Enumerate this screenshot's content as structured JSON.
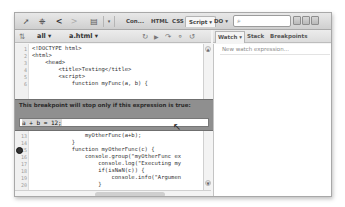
{
  "toolbar": {
    "icons": [
      "inspect-icon",
      "select-element-icon",
      "back-icon",
      "forward-icon",
      "menu-icon",
      "dropdown-icon"
    ],
    "tabs": [
      {
        "label": "Con..."
      },
      {
        "label": "HTML"
      },
      {
        "label": "CSS"
      },
      {
        "label": "Script ▾",
        "active": true
      },
      {
        "label": "DO ▾"
      }
    ],
    "search": {
      "placeholder": "",
      "value": "",
      "icon": "⌕"
    }
  },
  "script_bar": {
    "filter": "all ▾",
    "file": "a.html ▾",
    "controls": [
      "rerun-icon",
      "continue-icon",
      "step-over-icon",
      "step-into-icon",
      "step-out-icon"
    ]
  },
  "side_panel": {
    "tabs": [
      {
        "label": "Watch ▾",
        "active": true
      },
      {
        "label": "Stack"
      },
      {
        "label": "Breakpoints"
      }
    ],
    "new_watch": "New watch expression..."
  },
  "editor": {
    "lines": [
      {
        "n": "1",
        "code": "<!DOCTYPE html>"
      },
      {
        "n": "2",
        "code": "<html>"
      },
      {
        "n": "3",
        "code": "    <head>"
      },
      {
        "n": "4",
        "code": "        <title>Testing</title>"
      },
      {
        "n": "5",
        "code": "        <script>"
      },
      {
        "n": "6",
        "code": "            function myFunc(a, b) {"
      },
      {
        "n": "12",
        "code": "                console.groupEnd();"
      },
      {
        "n": "13",
        "code": "                myOtherFunc(a+b);"
      },
      {
        "n": "14",
        "code": "            }"
      },
      {
        "n": "15",
        "code": "            function myOtherFunc(c) {"
      },
      {
        "n": "16",
        "code": "                console.group(\"myOtherFunc ex"
      },
      {
        "n": "17",
        "code": "                    console.log(\"Executing my"
      },
      {
        "n": "18",
        "code": "                    if(isNaN(c)) {"
      },
      {
        "n": "19",
        "code": "                        console.info(\"Argumen"
      },
      {
        "n": "20",
        "code": "                    }"
      }
    ]
  },
  "breakpoint_popup": {
    "message": "This breakpoint will stop only if this expression is true:",
    "condition": "a + b = 12;"
  }
}
